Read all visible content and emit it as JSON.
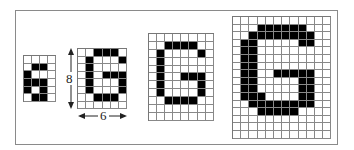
{
  "figure": {
    "colors": {
      "on": "#000000",
      "off": "#ffffff",
      "grid_line": "#888888",
      "frame": "#8a8a8a"
    },
    "dimension_labels": {
      "height": "8",
      "width": "6"
    },
    "grids": [
      {
        "name": "grid-4x6",
        "cols": 4,
        "rows": 6,
        "left": 23,
        "top": 55,
        "cell_w": 8,
        "cell_h": 7.7,
        "bitmap": [
          "0000",
          "0110",
          "1000",
          "1110",
          "1010",
          "0110"
        ]
      },
      {
        "name": "grid-6x8",
        "cols": 6,
        "rows": 8,
        "left": 77,
        "top": 48,
        "cell_w": 8.2,
        "cell_h": 7.5,
        "bitmap": [
          "001110",
          "010001",
          "010000",
          "010111",
          "010001",
          "010001",
          "001110",
          "000000"
        ]
      },
      {
        "name": "grid-8x11",
        "cols": 8,
        "rows": 11,
        "left": 148,
        "top": 33,
        "cell_w": 8.1,
        "cell_h": 7.9,
        "bitmap": [
          "00000000",
          "00111100",
          "01000010",
          "01000000",
          "01000000",
          "01001110",
          "01000010",
          "01000010",
          "00111100",
          "00000000",
          "00000000"
        ]
      },
      {
        "name": "grid-12x16",
        "cols": 12,
        "rows": 16,
        "left": 232,
        "top": 16,
        "cell_w": 8.2,
        "cell_h": 7.6,
        "bitmap": [
          "000000000000",
          "000111111000",
          "001111111100",
          "011000001100",
          "011000000000",
          "011000000000",
          "011000000000",
          "011001111100",
          "011000001100",
          "011000001100",
          "011100001100",
          "001111111100",
          "000111110000",
          "000000000000",
          "000000000000",
          "000000000000"
        ]
      }
    ]
  }
}
